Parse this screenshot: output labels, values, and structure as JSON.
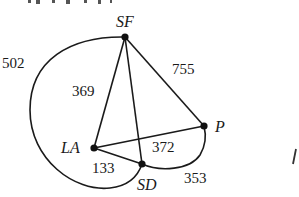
{
  "diagram": {
    "type": "weighted-graph",
    "nodes": [
      {
        "id": "SF",
        "label": "SF",
        "x": 125,
        "y": 37
      },
      {
        "id": "LA",
        "label": "LA",
        "x": 94,
        "y": 148
      },
      {
        "id": "SD",
        "label": "SD",
        "x": 142,
        "y": 164
      },
      {
        "id": "P",
        "label": "P",
        "x": 204,
        "y": 126
      }
    ],
    "edges": [
      {
        "from": "SF",
        "to": "LA",
        "weight": "369",
        "style": "straight"
      },
      {
        "from": "SF",
        "to": "SD",
        "weight": "",
        "style": "straight"
      },
      {
        "from": "SF",
        "to": "P",
        "weight": "755",
        "style": "straight"
      },
      {
        "from": "LA",
        "to": "P",
        "weight": "372",
        "style": "straight"
      },
      {
        "from": "LA",
        "to": "SD",
        "weight": "133",
        "style": "straight"
      },
      {
        "from": "SF",
        "to": "SD",
        "weight": "502",
        "style": "curved-left"
      },
      {
        "from": "SD",
        "to": "P",
        "weight": "353",
        "style": "curved-below"
      }
    ],
    "edge_labels": {
      "w502": "502",
      "w369": "369",
      "w755": "755",
      "w372": "372",
      "w133": "133",
      "w353": "353"
    },
    "stroke_color": "#1a1a1a",
    "partial_right_glyph": "I"
  }
}
